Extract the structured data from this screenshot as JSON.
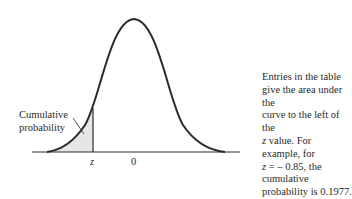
{
  "diagram": {
    "type": "standard-normal-curve",
    "shaded_region": "left tail up to z",
    "axis_labels": {
      "z": "z",
      "zero": "0"
    },
    "callout_label": [
      "Cumulative",
      "probability"
    ],
    "description": {
      "line1": "Entries in the table",
      "line2": "give the area under the",
      "line3": "curve to the left of the",
      "line4_var": "z",
      "line4_rest": " value. For example, for",
      "line5_var": "z",
      "line5_rest": " = – 0.85, the cumulative",
      "line6": "probability is 0.1977."
    },
    "colors": {
      "curve": "#2a2a2a",
      "shade": "#e6e6e6"
    }
  }
}
